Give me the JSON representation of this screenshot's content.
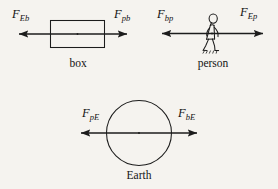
{
  "figure": {
    "kind": "free-body-force-pair-diagram",
    "background_color": "#f5f3ef",
    "ink_color": "#1c1c1c",
    "width": 278,
    "height": 189
  },
  "objects": [
    {
      "id": "box",
      "caption": "box",
      "shape": "rectangle"
    },
    {
      "id": "person",
      "caption": "person",
      "shape": "walking-figure"
    },
    {
      "id": "earth",
      "caption": "Earth",
      "shape": "circle"
    }
  ],
  "forces": [
    {
      "id": "F_Eb",
      "symbol": "F",
      "subscript": "Eb",
      "on_object": "box",
      "direction": "left",
      "meaning": "force of Earth on box"
    },
    {
      "id": "F_pb",
      "symbol": "F",
      "subscript": "pb",
      "on_object": "box",
      "direction": "right",
      "meaning": "force of person on box"
    },
    {
      "id": "F_bp",
      "symbol": "F",
      "subscript": "bp",
      "on_object": "person",
      "direction": "left",
      "meaning": "force of box on person"
    },
    {
      "id": "F_Ep",
      "symbol": "F",
      "subscript": "Ep",
      "on_object": "person",
      "direction": "right",
      "meaning": "force of Earth on person"
    },
    {
      "id": "F_pE",
      "symbol": "F",
      "subscript": "pE",
      "on_object": "earth",
      "direction": "left",
      "meaning": "force of person on Earth"
    },
    {
      "id": "F_bE",
      "symbol": "F",
      "subscript": "bE",
      "on_object": "earth",
      "direction": "right",
      "meaning": "force of box on Earth"
    }
  ]
}
